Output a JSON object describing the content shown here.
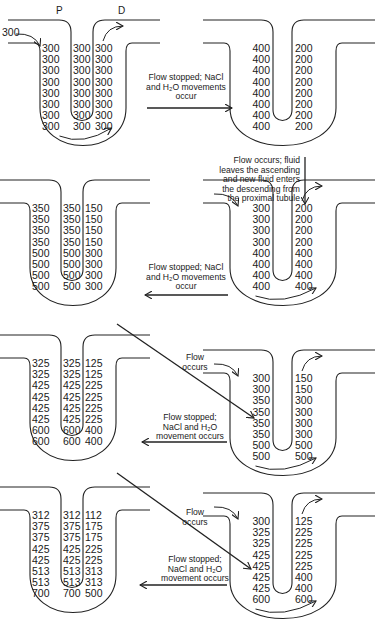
{
  "figure": {
    "limb_labels": {
      "proximal": "P",
      "distal": "D"
    },
    "inflow_value": "300"
  },
  "loops": [
    {
      "id": "loop1",
      "position": "top-left",
      "x": 20,
      "y": 0,
      "columns": 3,
      "descending": [
        "300",
        "300",
        "300",
        "300",
        "300",
        "300",
        "300",
        "300"
      ],
      "interstitial": [
        "300",
        "300",
        "300",
        "300",
        "300",
        "300",
        "300",
        "300"
      ],
      "ascending": [
        "300",
        "300",
        "300",
        "300",
        "300",
        "300",
        "300",
        "300"
      ],
      "show_labels": true,
      "show_inflow": true,
      "flow_arrows": true
    },
    {
      "id": "loop2",
      "position": "top-right",
      "x": 225,
      "y": 0,
      "columns": 2,
      "descending": [
        "400",
        "400",
        "400",
        "400",
        "400",
        "400",
        "400",
        "400"
      ],
      "ascending": [
        "200",
        "200",
        "200",
        "200",
        "200",
        "200",
        "200",
        "200"
      ],
      "flow_arrows": false
    },
    {
      "id": "loop3",
      "position": "row2-right",
      "x": 225,
      "y": 160,
      "columns": 2,
      "descending": [
        "300",
        "300",
        "300",
        "300",
        "400",
        "400",
        "400",
        "400"
      ],
      "ascending": [
        "200",
        "200",
        "200",
        "200",
        "400",
        "400",
        "400",
        "400"
      ],
      "flow_arrows": true
    },
    {
      "id": "loop4",
      "position": "row2-left",
      "x": 10,
      "y": 160,
      "columns": 3,
      "descending": [
        "350",
        "350",
        "350",
        "350",
        "500",
        "500",
        "500",
        "500"
      ],
      "interstitial": [
        "350",
        "350",
        "350",
        "350",
        "500",
        "500",
        "500",
        "500"
      ],
      "ascending": [
        "150",
        "150",
        "150",
        "150",
        "300",
        "300",
        "300",
        "300"
      ],
      "flow_arrows": false
    },
    {
      "id": "loop5",
      "position": "row3-left",
      "x": 10,
      "y": 315,
      "columns": 3,
      "descending": [
        "325",
        "325",
        "425",
        "425",
        "425",
        "425",
        "600",
        "600"
      ],
      "interstitial": [
        "325",
        "325",
        "425",
        "425",
        "425",
        "425",
        "600",
        "600"
      ],
      "ascending": [
        "125",
        "125",
        "225",
        "225",
        "225",
        "225",
        "400",
        "400"
      ],
      "flow_arrows": false
    },
    {
      "id": "loop6",
      "position": "row3-right",
      "x": 225,
      "y": 330,
      "columns": 2,
      "descending": [
        "300",
        "300",
        "350",
        "350",
        "350",
        "350",
        "500",
        "500"
      ],
      "ascending": [
        "150",
        "150",
        "300",
        "300",
        "300",
        "300",
        "500",
        "500"
      ],
      "flow_arrows": true
    },
    {
      "id": "loop7",
      "position": "row4-left",
      "x": 10,
      "y": 467,
      "columns": 3,
      "descending": [
        "312",
        "375",
        "375",
        "425",
        "425",
        "513",
        "513",
        "700"
      ],
      "interstitial": [
        "312",
        "375",
        "375",
        "425",
        "425",
        "513",
        "513",
        "700"
      ],
      "ascending": [
        "112",
        "175",
        "175",
        "225",
        "225",
        "313",
        "313",
        "500"
      ],
      "flow_arrows": false
    },
    {
      "id": "loop8",
      "position": "row4-right",
      "x": 225,
      "y": 473,
      "columns": 2,
      "descending": [
        "300",
        "325",
        "325",
        "425",
        "425",
        "425",
        "425",
        "600"
      ],
      "ascending": [
        "125",
        "225",
        "225",
        "225",
        "225",
        "400",
        "400",
        "600"
      ],
      "flow_arrows": true
    }
  ],
  "transitions": [
    {
      "id": "t1",
      "from": "loop1",
      "to": "loop2",
      "direction": "right",
      "lines": [
        "Flow stopped; NaCl",
        "and H₂O movements",
        "occur"
      ]
    },
    {
      "id": "t2",
      "from": "loop2",
      "to": "loop3",
      "direction": "down",
      "lines": [
        "Flow occurs; fluid",
        "leaves the ascending",
        "and new fluid enters",
        "the descending from",
        "the proximal tubule"
      ]
    },
    {
      "id": "t3",
      "from": "loop3",
      "to": "loop4",
      "direction": "left",
      "lines": [
        "Flow stopped; NaCl",
        "and H₂O movements",
        "occur"
      ]
    },
    {
      "id": "t4",
      "from": "loop4",
      "to": "loop6",
      "direction": "diagonal",
      "lines": [
        "Flow",
        "occurs"
      ]
    },
    {
      "id": "t5",
      "from": "loop6",
      "to": "loop5",
      "direction": "left",
      "lines": [
        "Flow stopped;",
        "NaCl and H₂O",
        "movement occurs"
      ]
    },
    {
      "id": "t6",
      "from": "loop5",
      "to": "loop8",
      "direction": "diagonal",
      "lines": [
        "Flow",
        "occurs"
      ]
    },
    {
      "id": "t7",
      "from": "loop8",
      "to": "loop7",
      "direction": "left",
      "lines": [
        "Flow stopped;",
        "NaCl and H₂O",
        "movement occurs"
      ]
    }
  ]
}
